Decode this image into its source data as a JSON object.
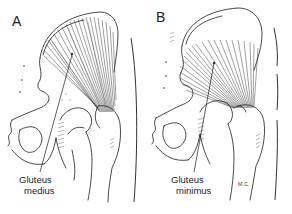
{
  "figure": {
    "panels": [
      {
        "letter": "A",
        "muscle_label_line1": "Gluteus",
        "muscle_label_line2": "medius"
      },
      {
        "letter": "B",
        "muscle_label_line1": "Gluteus",
        "muscle_label_line2": "minimus",
        "artist_initials": "M.C."
      }
    ],
    "colors": {
      "background": "#ffffff",
      "ink": "#1a1a1a"
    }
  }
}
